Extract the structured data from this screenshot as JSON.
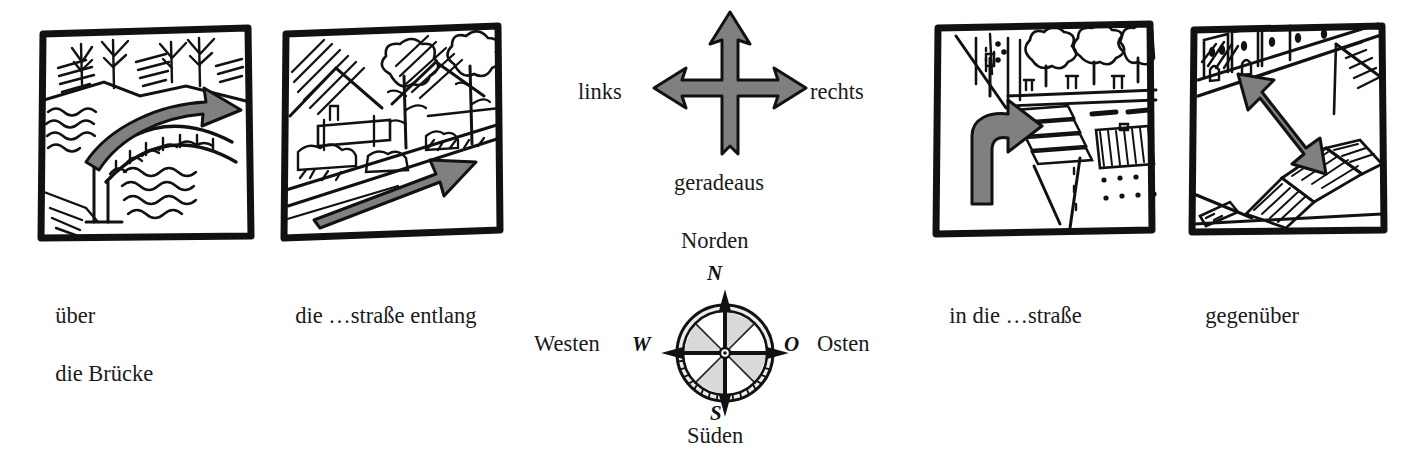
{
  "colors": {
    "ink": "#1a1a1a",
    "arrow_gray": "#808080",
    "arrow_gray_dark": "#6f6f6f",
    "compass_wedge_light": "#dcdcdc",
    "compass_wedge_dark": "#b8b8b8",
    "paper": "#ffffff"
  },
  "panels": [
    {
      "id": "bridge",
      "icon": "bridge-over-river-sketch",
      "caption_line1": "über",
      "caption_line2": "die Brücke"
    },
    {
      "id": "street-along",
      "icon": "street-with-trees-sketch",
      "caption_line1": "die …straße entlang",
      "caption_line2": ""
    },
    {
      "id": "into-street",
      "icon": "crosswalk-turn-sketch",
      "caption_line1": "in die …straße",
      "caption_line2": ""
    },
    {
      "id": "opposite",
      "icon": "buildings-across-square-sketch",
      "caption_line1": "gegenüber",
      "caption_line2": ""
    }
  ],
  "direction_cross": {
    "icon": "three-way-arrow-cross",
    "left_label": "links",
    "right_label": "rechts",
    "bottom_label": "geradeaus"
  },
  "compass": {
    "icon": "compass-rose",
    "north_word": "Norden",
    "south_word": "Süden",
    "west_word": "Westen",
    "east_word": "Osten",
    "north_letter": "N",
    "south_letter": "S",
    "west_letter": "W",
    "east_letter": "O"
  }
}
